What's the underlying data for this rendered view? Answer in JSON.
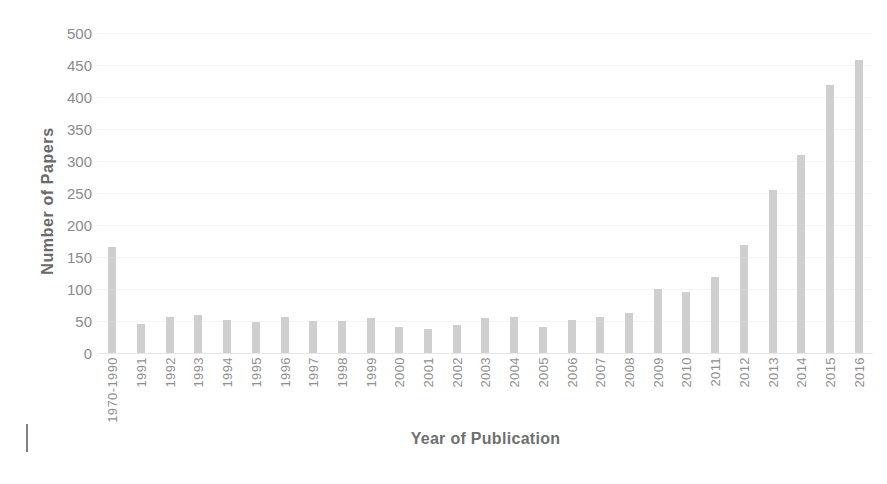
{
  "chart_data": {
    "type": "bar",
    "title": "",
    "xlabel": "Year of Publication",
    "ylabel": "Number of Papers",
    "ylim": [
      0,
      500
    ],
    "ytick_step": 50,
    "yticks": [
      500,
      450,
      400,
      350,
      300,
      250,
      200,
      150,
      100,
      50,
      0
    ],
    "grid": true,
    "legend": null,
    "bar_color": "#cfcfcf",
    "axis_text_color": "#8a8a8a",
    "categories": [
      "1970-1990",
      "1991",
      "1992",
      "1993",
      "1994",
      "1995",
      "1996",
      "1997",
      "1998",
      "1999",
      "2000",
      "2001",
      "2002",
      "2003",
      "2004",
      "2005",
      "2006",
      "2007",
      "2008",
      "2009",
      "2010",
      "2011",
      "2012",
      "2013",
      "2014",
      "2015",
      "2016"
    ],
    "values": [
      165,
      45,
      57,
      60,
      52,
      48,
      56,
      50,
      50,
      54,
      40,
      38,
      43,
      55,
      57,
      40,
      52,
      57,
      63,
      100,
      96,
      118,
      168,
      255,
      310,
      419,
      458
    ]
  },
  "figure": {
    "background": "#ffffff",
    "left_margin_tick": "margin-tick"
  }
}
